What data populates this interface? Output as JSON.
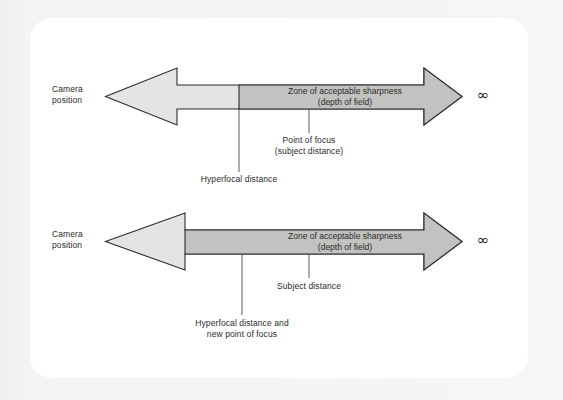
{
  "page": {
    "background_color": "#f3f3f1",
    "card_color": "#ffffff"
  },
  "colors": {
    "arrow_light_fill": "#e4e4e2",
    "zone_dark_fill": "#c2c2c0",
    "outline": "#2b2b2b",
    "text": "#2b2b2b",
    "leader_line": "#4a4a4a"
  },
  "diagrams": [
    {
      "id": "top-diagram",
      "camera_label_line1": "Camera",
      "camera_label_line2": "position",
      "zone_label_line1": "Zone of acceptable sharpness",
      "zone_label_line2": "(depth of field)",
      "infinity_symbol": "∞",
      "callouts": [
        {
          "name": "point-of-focus",
          "line1": "Point of focus",
          "line2": "(subject distance)"
        },
        {
          "name": "hyperfocal-distance",
          "line1": "Hyperfocal distance",
          "line2": ""
        }
      ]
    },
    {
      "id": "bottom-diagram",
      "camera_label_line1": "Camera",
      "camera_label_line2": "position",
      "zone_label_line1": "Zone of acceptable sharpness",
      "zone_label_line2": "(depth of field)",
      "infinity_symbol": "∞",
      "callouts": [
        {
          "name": "subject-distance",
          "line1": "Subject distance",
          "line2": ""
        },
        {
          "name": "hyperfocal-distance-new-focus",
          "line1": "Hyperfocal distance and",
          "line2": "new point of focus"
        }
      ]
    }
  ]
}
